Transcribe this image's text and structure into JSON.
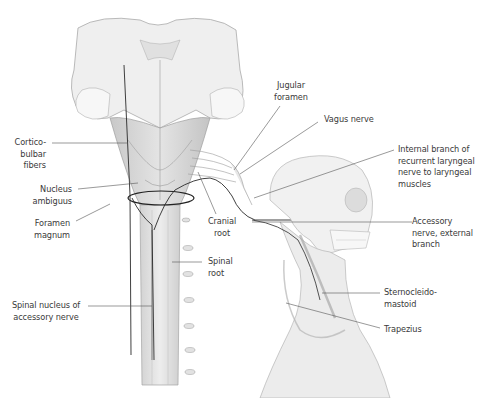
{
  "figure": {
    "colors": {
      "background": "#ffffff",
      "label_text": "#3a3a3a",
      "leader_line": "#555555",
      "tissue_light": "#ececec",
      "tissue_mid": "#d6d6d6",
      "tissue_dark": "#b5b5b5",
      "nerve": "#2a2a2a"
    }
  },
  "labels": {
    "corticobulbar": "Cortico-\nbulbar\nfibers",
    "nucleus_ambiguus": "Nucleus\nambiguus",
    "foramen_magnum": "Foramen\nmagnum",
    "spinal_nucleus": "Spinal nucleus of\naccessory nerve",
    "jugular_foramen": "Jugular\nforamen",
    "vagus_nerve": "Vagus nerve",
    "internal_branch": "Internal branch of\nrecurrent laryngeal\nnerve to laryngeal\nmuscles",
    "cranial_root": "Cranial\nroot",
    "spinal_root": "Spinal\nroot",
    "accessory_external": "Accessory\nnerve, external\nbranch",
    "sternocleidomastoid": "Sternocleido-\nmastoid",
    "trapezius": "Trapezius"
  }
}
